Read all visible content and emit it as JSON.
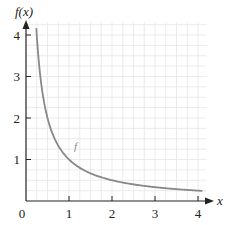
{
  "chart_data": {
    "type": "line",
    "title": "",
    "xlabel": "x",
    "ylabel": "f(x)",
    "xlim": [
      0,
      4.2
    ],
    "ylim": [
      0,
      4.3
    ],
    "x_ticks": [
      "0",
      "1",
      "2",
      "3",
      "4"
    ],
    "y_ticks": [
      "1",
      "2",
      "3",
      "4"
    ],
    "grid": true,
    "grid_minor_step": 0.25,
    "legend": null,
    "series": [
      {
        "name": "f",
        "function": "f(x) = 1/x",
        "color": "#888888",
        "x": [
          0.24,
          0.3,
          0.4,
          0.5,
          0.6,
          0.75,
          1.0,
          1.25,
          1.5,
          2.0,
          2.5,
          3.0,
          3.5,
          4.0,
          4.1
        ],
        "y": [
          4.17,
          3.33,
          2.5,
          2.0,
          1.67,
          1.33,
          1.0,
          0.8,
          0.67,
          0.5,
          0.4,
          0.33,
          0.29,
          0.25,
          0.24
        ]
      }
    ],
    "annotations": [
      {
        "text": "f",
        "x": 1.1,
        "y": 1.3
      }
    ]
  },
  "labels": {
    "y_axis": "f(x)",
    "x_axis": "x",
    "origin": "0",
    "x1": "1",
    "x2": "2",
    "x3": "3",
    "x4": "4",
    "y1": "1",
    "y2": "2",
    "y3": "3",
    "y4": "4",
    "curve": "f"
  }
}
